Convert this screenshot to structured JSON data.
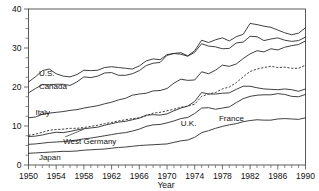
{
  "chart_data": {
    "type": "line",
    "title": "",
    "xlabel": "Year",
    "ylabel": "",
    "xlim": [
      1950,
      1990
    ],
    "ylim": [
      0,
      40
    ],
    "grid": false,
    "legend_position": "inline-labels",
    "xticks": [
      1950,
      1954,
      1958,
      1962,
      1966,
      1970,
      1974,
      1978,
      1982,
      1986,
      1990
    ],
    "xtick_labels": [
      "1950",
      "1954",
      "1958",
      "1962",
      "1966",
      "1970",
      "1974",
      "1978",
      "1982",
      "1986",
      "1990"
    ],
    "xminor_step": 1,
    "yticks": [
      0,
      10,
      20,
      30,
      40
    ],
    "ytick_labels": [
      "0",
      "10",
      "20",
      "30",
      "40"
    ],
    "yminor_step": 2.5,
    "x": [
      1950,
      1951,
      1952,
      1953,
      1954,
      1955,
      1956,
      1957,
      1958,
      1959,
      1960,
      1961,
      1962,
      1963,
      1964,
      1965,
      1966,
      1967,
      1968,
      1969,
      1970,
      1971,
      1972,
      1973,
      1974,
      1975,
      1976,
      1977,
      1978,
      1979,
      1980,
      1981,
      1982,
      1983,
      1984,
      1985,
      1986,
      1987,
      1988,
      1989,
      1990
    ],
    "series": [
      {
        "name": "U.S.",
        "style": "solid",
        "label_x": 1951.5,
        "label_y": 22.7,
        "values": [
          21.3,
          22.6,
          24.2,
          24.6,
          23.4,
          22.8,
          22.6,
          23.2,
          24.3,
          24.2,
          24.3,
          25.0,
          25.2,
          25.0,
          24.8,
          24.6,
          25.4,
          26.7,
          27.2,
          27.0,
          28.3,
          28.6,
          28.4,
          27.9,
          28.9,
          31.1,
          30.5,
          30.3,
          29.8,
          29.9,
          31.3,
          31.5,
          33.0,
          32.9,
          31.9,
          32.3,
          32.6,
          32.0,
          31.7,
          31.9,
          32.8
        ]
      },
      {
        "name": "Canada",
        "style": "solid",
        "label_x": 1951.5,
        "label_y": 19.6,
        "values": [
          18.5,
          19.6,
          20.6,
          20.6,
          20.7,
          20.7,
          20.4,
          21.3,
          22.6,
          22.4,
          22.8,
          23.6,
          23.7,
          23.0,
          23.0,
          23.4,
          24.2,
          25.5,
          26.1,
          26.3,
          28.1,
          28.6,
          28.8,
          28.0,
          29.3,
          32.0,
          31.4,
          32.1,
          32.6,
          31.8,
          32.9,
          33.5,
          36.3,
          36.0,
          35.6,
          35.3,
          34.6,
          33.9,
          33.4,
          33.8,
          35.2
        ]
      },
      {
        "name": "France",
        "style": "dashed",
        "label_x": 1977.5,
        "label_y": 11.2,
        "values": [
          7.6,
          7.9,
          8.4,
          8.9,
          9.1,
          9.2,
          9.4,
          9.4,
          9.6,
          9.9,
          10.2,
          10.6,
          10.9,
          11.3,
          11.6,
          11.9,
          12.1,
          12.6,
          13.3,
          13.5,
          13.9,
          14.3,
          14.8,
          15.1,
          15.6,
          17.6,
          18.2,
          18.6,
          19.5,
          20.0,
          21.1,
          22.6,
          24.0,
          24.6,
          25.0,
          25.3,
          25.0,
          25.1,
          24.8,
          24.8,
          25.6
        ]
      },
      {
        "name": "Italy",
        "style": "solid",
        "label_x": 1951.0,
        "label_y": 12.8,
        "values": [
          12.1,
          12.3,
          13.0,
          13.3,
          13.5,
          13.7,
          14.0,
          14.2,
          14.6,
          14.9,
          15.2,
          15.7,
          16.1,
          16.7,
          17.1,
          17.9,
          18.2,
          18.4,
          19.0,
          19.1,
          19.6,
          21.0,
          22.0,
          21.7,
          21.8,
          23.9,
          23.4,
          24.3,
          25.6,
          25.3,
          25.9,
          27.3,
          28.5,
          29.3,
          29.0,
          29.8,
          29.5,
          30.2,
          30.6,
          30.9,
          31.8
        ]
      },
      {
        "name": "West Germany",
        "style": "solid",
        "label_x": 1955.0,
        "label_y": 5.4,
        "values": [
          7.3,
          7.4,
          7.7,
          8.1,
          8.4,
          8.3,
          8.6,
          9.0,
          9.3,
          9.5,
          9.7,
          10.2,
          10.6,
          11.0,
          11.2,
          11.6,
          12.0,
          12.8,
          12.9,
          12.8,
          13.1,
          13.9,
          14.6,
          15.1,
          16.3,
          18.6,
          18.2,
          18.2,
          18.4,
          18.5,
          19.4,
          20.2,
          20.2,
          19.8,
          19.5,
          19.4,
          19.3,
          19.5,
          19.3,
          18.9,
          19.5
        ]
      },
      {
        "name": "U.K.",
        "style": "solid",
        "label_x": 1972.0,
        "label_y": 10.0,
        "values": [
          5.3,
          5.4,
          5.6,
          5.8,
          5.9,
          6.0,
          6.2,
          6.4,
          6.7,
          6.9,
          7.2,
          7.5,
          7.8,
          8.1,
          8.3,
          8.7,
          9.2,
          9.9,
          10.3,
          10.4,
          10.8,
          11.3,
          11.9,
          12.2,
          13.2,
          14.6,
          14.7,
          14.3,
          14.6,
          14.9,
          16.0,
          17.0,
          17.6,
          17.9,
          18.0,
          18.0,
          18.3,
          18.1,
          17.6,
          17.5,
          18.1
        ]
      },
      {
        "name": "Japan",
        "style": "solid",
        "label_x": 1951.5,
        "label_y": 1.3,
        "values": [
          3.0,
          3.1,
          3.2,
          3.3,
          3.4,
          3.5,
          3.5,
          3.6,
          3.8,
          3.9,
          4.0,
          4.1,
          4.3,
          4.5,
          4.6,
          4.8,
          5.0,
          5.1,
          5.2,
          5.3,
          5.4,
          5.8,
          6.2,
          6.4,
          7.1,
          8.3,
          8.8,
          9.4,
          9.9,
          10.3,
          10.6,
          11.1,
          11.4,
          11.6,
          11.5,
          11.5,
          11.8,
          11.9,
          11.8,
          11.7,
          12.1
        ]
      }
    ]
  },
  "labels": {
    "us": "U.S.",
    "canada": "Canada",
    "italy": "Italy",
    "west_germany": "West Germany",
    "uk": "U.K.",
    "japan": "Japan",
    "france": "France"
  },
  "axis": {
    "x_title": "Year",
    "y_min_label": "0",
    "y_10_label": "10",
    "y_20_label": "20",
    "y_30_label": "30",
    "y_40_label": "40",
    "x_1950": "1950",
    "x_1954": "1954",
    "x_1958": "1958",
    "x_1962": "1962",
    "x_1966": "1966",
    "x_1970": "1970",
    "x_1974": "1974",
    "x_1978": "1978",
    "x_1982": "1982",
    "x_1986": "1986",
    "x_1990": "1990"
  }
}
